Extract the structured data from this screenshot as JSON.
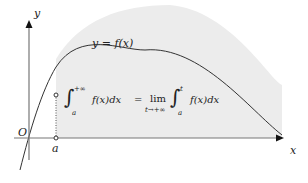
{
  "diagram": {
    "curve_label": "y = f(x)",
    "axes": {
      "x_label": "x",
      "y_label": "y",
      "origin_label": "O"
    },
    "point_label": "a",
    "formula": {
      "lhs_integral_upper": "+∞",
      "lhs_integral_lower": "a",
      "lhs_integrand": "f(x)dx",
      "equals": "=",
      "lim": "lim",
      "lim_sub": "t→+∞",
      "rhs_integral_upper": "t",
      "rhs_integral_lower": "a",
      "rhs_integrand": "f(x)dx"
    },
    "colors": {
      "fill": "#ededed",
      "curve": "#333333",
      "axis": "#555555"
    }
  }
}
